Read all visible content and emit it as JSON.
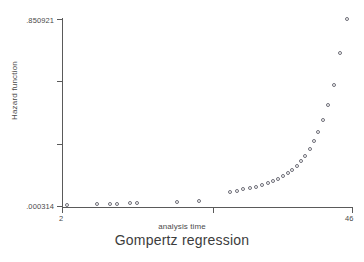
{
  "chart_data": {
    "type": "scatter",
    "title": "Gompertz regression",
    "xlabel": "analysis time",
    "ylabel": "Hazard function",
    "xlim": [
      2,
      46
    ],
    "ylim": [
      0.000314,
      0.850921
    ],
    "xticks": [
      "2",
      "46"
    ],
    "yticks": [
      ".000314",
      ".850921"
    ],
    "ytick_label_top": ".850921",
    "ytick_label_bottom": ".000314",
    "xtick_label_left": "2",
    "xtick_label_right": "46",
    "grid": false,
    "legend": false,
    "marker": "open-circle",
    "marker_color": "#6e6e78",
    "axis_color": "#5a5a5a",
    "background": "#ffffff",
    "x": [
      2,
      6,
      8,
      9,
      11,
      12,
      17,
      20,
      24,
      25,
      26,
      27,
      28,
      29,
      30,
      31,
      32,
      33,
      34,
      35,
      36,
      37,
      38,
      39,
      40,
      41,
      42,
      43,
      44,
      45,
      46
    ],
    "y": [
      0.000314,
      0.0009,
      0.0012,
      0.0013,
      0.0018,
      0.0019,
      0.0055,
      0.0099,
      0.0255,
      0.0302,
      0.0349,
      0.0394,
      0.0443,
      0.0497,
      0.0556,
      0.0621,
      0.0695,
      0.0785,
      0.0889,
      0.1008,
      0.1152,
      0.1329,
      0.1545,
      0.1812,
      0.2146,
      0.2556,
      0.3074,
      0.3731,
      0.4587,
      0.6044,
      0.8509
    ],
    "points_px": [
      {
        "x": 67,
        "y": 205
      },
      {
        "x": 97,
        "y": 204
      },
      {
        "x": 110,
        "y": 204
      },
      {
        "x": 117,
        "y": 204
      },
      {
        "x": 130,
        "y": 203
      },
      {
        "x": 137,
        "y": 203
      },
      {
        "x": 177,
        "y": 202
      },
      {
        "x": 199,
        "y": 201
      },
      {
        "x": 230,
        "y": 192
      },
      {
        "x": 237,
        "y": 191
      },
      {
        "x": 243,
        "y": 189
      },
      {
        "x": 250,
        "y": 188
      },
      {
        "x": 256,
        "y": 187
      },
      {
        "x": 262,
        "y": 185
      },
      {
        "x": 268,
        "y": 183
      },
      {
        "x": 273,
        "y": 181
      },
      {
        "x": 278,
        "y": 179
      },
      {
        "x": 283,
        "y": 176
      },
      {
        "x": 288,
        "y": 173
      },
      {
        "x": 292,
        "y": 170
      },
      {
        "x": 297,
        "y": 166
      },
      {
        "x": 301,
        "y": 161
      },
      {
        "x": 305,
        "y": 156
      },
      {
        "x": 310,
        "y": 149
      },
      {
        "x": 314,
        "y": 141
      },
      {
        "x": 318,
        "y": 132
      },
      {
        "x": 323,
        "y": 120
      },
      {
        "x": 328,
        "y": 105
      },
      {
        "x": 334,
        "y": 85
      },
      {
        "x": 340,
        "y": 53
      },
      {
        "x": 347,
        "y": 19
      }
    ]
  }
}
